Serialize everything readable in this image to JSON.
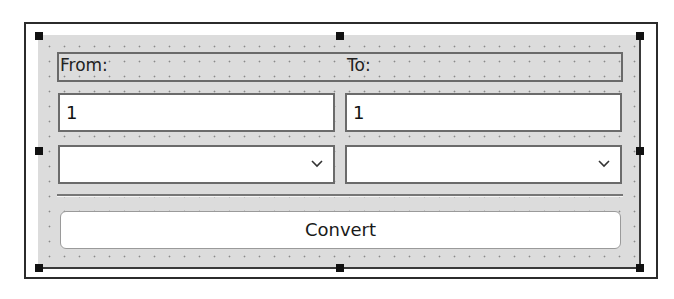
{
  "form": {
    "from_label": "From:",
    "to_label": "To:",
    "from_value": "1",
    "to_value": "1",
    "from_unit_selected": "",
    "to_unit_selected": "",
    "convert_label": "Convert"
  },
  "icons": {
    "combo_arrow": "chevron-down-icon",
    "selection_handle": "resize-handle"
  },
  "colors": {
    "form_background": "#dcdcdc",
    "grid_dot": "#8a8a8a",
    "handle": "#111111",
    "frame_border": "#2b2b2b"
  }
}
